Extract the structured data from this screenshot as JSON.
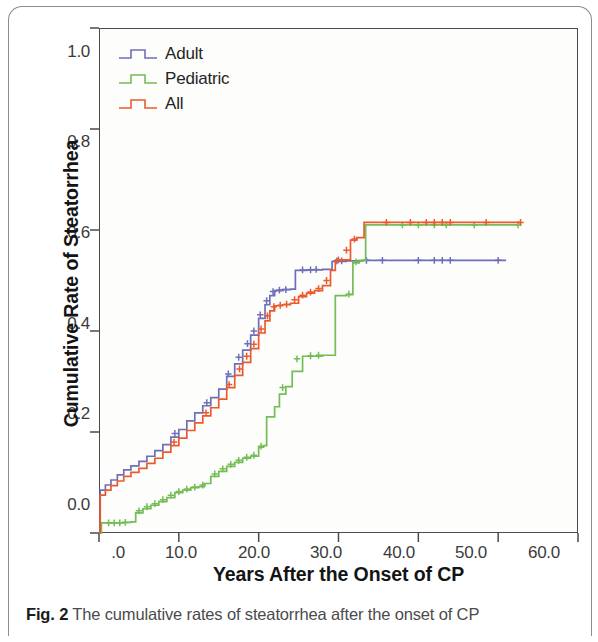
{
  "figure": {
    "caption_lead": "Fig. 2",
    "caption_text": " The cumulative rates of steatorrhea after the onset of CP"
  },
  "legend": {
    "position": "top-left-inside",
    "items": [
      {
        "label": "Adult",
        "color": "#6f6fb8",
        "symbol": "step-line"
      },
      {
        "label": "Pediatric",
        "color": "#74bd55",
        "symbol": "step-line"
      },
      {
        "label": "All",
        "color": "#ec5a2c",
        "symbol": "step-line"
      }
    ]
  },
  "axes": {
    "x_label": "Years After the Onset of CP",
    "y_label": "Cumulative Rate of Steatorrhea",
    "x_ticks": [
      ".0",
      "10.0",
      "20.0",
      "30.0",
      "40.0",
      "50.0",
      "60.0"
    ],
    "y_ticks": [
      "0.0",
      "0.2",
      "0.4",
      "0.6",
      "0.8",
      "1.0"
    ]
  },
  "chart_data": {
    "type": "line",
    "title": "The cumulative rates of steatorrhea after the onset of CP",
    "subtitle": "",
    "xlabel": "Years After the Onset of CP",
    "ylabel": "Cumulative Rate of Steatorrhea",
    "xlim": [
      0,
      60
    ],
    "ylim": [
      0.0,
      1.0
    ],
    "xticks": [
      0,
      10,
      20,
      30,
      40,
      50,
      60
    ],
    "xticklabels": [
      ".0",
      "10.0",
      "20.0",
      "30.0",
      "40.0",
      "50.0",
      "60.0"
    ],
    "yticks": [
      0.0,
      0.2,
      0.4,
      0.6,
      0.8,
      1.0
    ],
    "yticklabels": [
      "0.0",
      "0.2",
      "0.4",
      "0.6",
      "0.8",
      "1.0"
    ],
    "grid": false,
    "legend_position": "upper left",
    "interpolation": "step-after",
    "note": "Kaplan-Meier cumulative incidence curves with '+' censoring marks",
    "series": [
      {
        "name": "Adult",
        "color": "#6f6fb8",
        "points": [
          [
            0.0,
            0.0
          ],
          [
            0.15,
            0.085
          ],
          [
            0.8,
            0.095
          ],
          [
            1.5,
            0.105
          ],
          [
            2.3,
            0.115
          ],
          [
            3.1,
            0.125
          ],
          [
            4.0,
            0.133
          ],
          [
            5.0,
            0.142
          ],
          [
            6.0,
            0.152
          ],
          [
            7.0,
            0.163
          ],
          [
            8.0,
            0.175
          ],
          [
            9.0,
            0.19
          ],
          [
            10.0,
            0.205
          ],
          [
            11.0,
            0.222
          ],
          [
            12.0,
            0.238
          ],
          [
            13.0,
            0.252
          ],
          [
            14.0,
            0.268
          ],
          [
            15.0,
            0.285
          ],
          [
            16.0,
            0.31
          ],
          [
            17.0,
            0.335
          ],
          [
            18.0,
            0.362
          ],
          [
            19.0,
            0.392
          ],
          [
            20.0,
            0.425
          ],
          [
            20.8,
            0.452
          ],
          [
            21.4,
            0.47
          ],
          [
            22.0,
            0.48
          ],
          [
            23.0,
            0.482
          ],
          [
            24.0,
            0.483
          ],
          [
            24.6,
            0.52
          ],
          [
            26.0,
            0.521
          ],
          [
            28.0,
            0.522
          ],
          [
            29.2,
            0.538
          ],
          [
            31.0,
            0.539
          ],
          [
            33.0,
            0.54
          ],
          [
            36.0,
            0.54
          ],
          [
            40.0,
            0.54
          ],
          [
            44.0,
            0.54
          ],
          [
            50.0,
            0.54
          ],
          [
            51.0,
            0.54
          ]
        ],
        "censor_marks": [
          [
            9.5,
            0.197
          ],
          [
            13.5,
            0.258
          ],
          [
            16.2,
            0.315
          ],
          [
            17.5,
            0.348
          ],
          [
            18.6,
            0.375
          ],
          [
            19.4,
            0.4
          ],
          [
            20.2,
            0.432
          ],
          [
            21.0,
            0.46
          ],
          [
            21.8,
            0.478
          ],
          [
            22.6,
            0.481
          ],
          [
            23.4,
            0.482
          ],
          [
            25.5,
            0.521
          ],
          [
            26.5,
            0.521
          ],
          [
            27.2,
            0.522
          ],
          [
            29.8,
            0.539
          ],
          [
            30.4,
            0.539
          ],
          [
            33.5,
            0.54
          ],
          [
            35.5,
            0.54
          ],
          [
            40.0,
            0.54
          ],
          [
            42.0,
            0.54
          ],
          [
            43.0,
            0.54
          ],
          [
            44.0,
            0.54
          ],
          [
            50.0,
            0.54
          ]
        ],
        "final_value": 0.54
      },
      {
        "name": "Pediatric",
        "color": "#74bd55",
        "points": [
          [
            0.0,
            0.0
          ],
          [
            0.3,
            0.02
          ],
          [
            1.0,
            0.02
          ],
          [
            2.0,
            0.02
          ],
          [
            3.0,
            0.021
          ],
          [
            4.0,
            0.022
          ],
          [
            4.6,
            0.04
          ],
          [
            5.5,
            0.048
          ],
          [
            6.5,
            0.055
          ],
          [
            7.5,
            0.062
          ],
          [
            8.5,
            0.07
          ],
          [
            9.5,
            0.08
          ],
          [
            10.5,
            0.085
          ],
          [
            11.5,
            0.09
          ],
          [
            12.5,
            0.092
          ],
          [
            13.2,
            0.098
          ],
          [
            14.0,
            0.112
          ],
          [
            15.0,
            0.122
          ],
          [
            16.0,
            0.132
          ],
          [
            17.0,
            0.14
          ],
          [
            18.0,
            0.148
          ],
          [
            19.0,
            0.152
          ],
          [
            20.0,
            0.17
          ],
          [
            20.6,
            0.173
          ],
          [
            21.0,
            0.23
          ],
          [
            22.0,
            0.25
          ],
          [
            22.6,
            0.275
          ],
          [
            23.4,
            0.29
          ],
          [
            24.2,
            0.32
          ],
          [
            25.5,
            0.35
          ],
          [
            28.0,
            0.352
          ],
          [
            29.0,
            0.352
          ],
          [
            29.6,
            0.47
          ],
          [
            31.0,
            0.472
          ],
          [
            31.8,
            0.535
          ],
          [
            32.6,
            0.54
          ],
          [
            33.4,
            0.61
          ],
          [
            38.0,
            0.61
          ],
          [
            42.0,
            0.61
          ],
          [
            46.0,
            0.61
          ],
          [
            52.5,
            0.61
          ]
        ],
        "censor_marks": [
          [
            1.2,
            0.02
          ],
          [
            1.9,
            0.02
          ],
          [
            2.6,
            0.02
          ],
          [
            3.3,
            0.021
          ],
          [
            5.0,
            0.044
          ],
          [
            6.0,
            0.052
          ],
          [
            7.0,
            0.058
          ],
          [
            8.0,
            0.066
          ],
          [
            9.0,
            0.075
          ],
          [
            10.0,
            0.082
          ],
          [
            11.0,
            0.087
          ],
          [
            12.0,
            0.091
          ],
          [
            13.0,
            0.095
          ],
          [
            14.5,
            0.117
          ],
          [
            15.5,
            0.127
          ],
          [
            16.5,
            0.136
          ],
          [
            17.5,
            0.144
          ],
          [
            18.5,
            0.15
          ],
          [
            19.4,
            0.154
          ],
          [
            20.3,
            0.172
          ],
          [
            23.0,
            0.288
          ],
          [
            24.8,
            0.345
          ],
          [
            26.5,
            0.351
          ],
          [
            27.5,
            0.352
          ],
          [
            31.3,
            0.473
          ],
          [
            32.2,
            0.537
          ],
          [
            38.0,
            0.61
          ],
          [
            40.0,
            0.61
          ],
          [
            42.0,
            0.61
          ],
          [
            43.5,
            0.61
          ],
          [
            47.0,
            0.61
          ],
          [
            52.5,
            0.61
          ]
        ],
        "final_value": 0.61
      },
      {
        "name": "All",
        "color": "#ec5a2c",
        "points": [
          [
            0.0,
            0.0
          ],
          [
            0.15,
            0.075
          ],
          [
            0.8,
            0.085
          ],
          [
            1.5,
            0.094
          ],
          [
            2.3,
            0.103
          ],
          [
            3.1,
            0.112
          ],
          [
            4.0,
            0.12
          ],
          [
            5.0,
            0.128
          ],
          [
            6.0,
            0.138
          ],
          [
            7.0,
            0.148
          ],
          [
            8.0,
            0.16
          ],
          [
            9.0,
            0.173
          ],
          [
            10.0,
            0.188
          ],
          [
            11.0,
            0.203
          ],
          [
            12.0,
            0.218
          ],
          [
            13.0,
            0.232
          ],
          [
            14.0,
            0.248
          ],
          [
            15.0,
            0.265
          ],
          [
            16.0,
            0.288
          ],
          [
            17.0,
            0.312
          ],
          [
            18.0,
            0.338
          ],
          [
            19.0,
            0.365
          ],
          [
            20.0,
            0.396
          ],
          [
            20.8,
            0.42
          ],
          [
            21.4,
            0.44
          ],
          [
            22.0,
            0.45
          ],
          [
            23.0,
            0.452
          ],
          [
            24.0,
            0.455
          ],
          [
            25.0,
            0.468
          ],
          [
            26.0,
            0.475
          ],
          [
            27.0,
            0.48
          ],
          [
            28.0,
            0.49
          ],
          [
            29.0,
            0.52
          ],
          [
            29.6,
            0.54
          ],
          [
            30.5,
            0.541
          ],
          [
            31.5,
            0.58
          ],
          [
            32.3,
            0.585
          ],
          [
            33.2,
            0.615
          ],
          [
            38.0,
            0.615
          ],
          [
            43.0,
            0.615
          ],
          [
            48.0,
            0.615
          ],
          [
            52.8,
            0.615
          ]
        ],
        "censor_marks": [
          [
            9.4,
            0.18
          ],
          [
            13.4,
            0.238
          ],
          [
            16.3,
            0.294
          ],
          [
            17.6,
            0.325
          ],
          [
            18.5,
            0.35
          ],
          [
            19.4,
            0.374
          ],
          [
            20.3,
            0.404
          ],
          [
            21.1,
            0.43
          ],
          [
            21.9,
            0.448
          ],
          [
            22.7,
            0.451
          ],
          [
            23.5,
            0.453
          ],
          [
            24.5,
            0.462
          ],
          [
            25.5,
            0.471
          ],
          [
            26.5,
            0.477
          ],
          [
            27.5,
            0.484
          ],
          [
            28.5,
            0.5
          ],
          [
            30.0,
            0.541
          ],
          [
            31.0,
            0.56
          ],
          [
            32.0,
            0.582
          ],
          [
            36.0,
            0.615
          ],
          [
            39.0,
            0.615
          ],
          [
            41.0,
            0.615
          ],
          [
            42.0,
            0.615
          ],
          [
            43.0,
            0.615
          ],
          [
            44.0,
            0.615
          ],
          [
            48.5,
            0.615
          ],
          [
            52.8,
            0.615
          ]
        ],
        "final_value": 0.615
      }
    ]
  }
}
